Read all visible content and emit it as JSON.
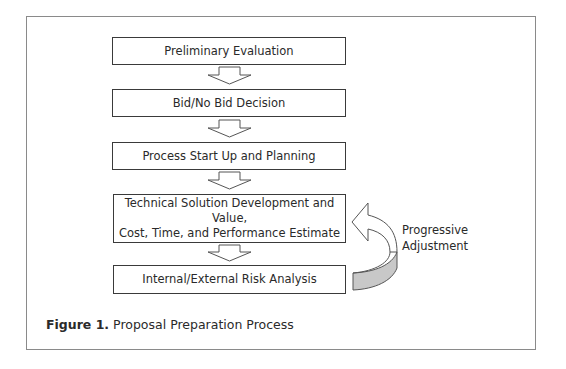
{
  "diagram": {
    "type": "flowchart",
    "steps": [
      {
        "label": "Preliminary Evaluation"
      },
      {
        "label": "Bid/No Bid Decision"
      },
      {
        "label": "Process Start Up and Planning"
      },
      {
        "label_line1": "Technical Solution Development and Value,",
        "label_line2": "Cost, Time, and Performance Estimate"
      },
      {
        "label": "Internal/External Risk Analysis"
      }
    ],
    "feedback": {
      "label_line1": "Progressive",
      "label_line2": "Adjustment",
      "from_step": 5,
      "to_step": 4,
      "fill_color": "#c8c8c8"
    }
  },
  "caption": {
    "prefix": "Figure 1.",
    "text": " Proposal Preparation Process"
  }
}
